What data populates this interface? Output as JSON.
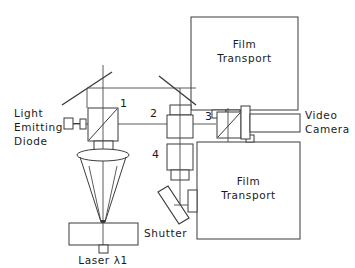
{
  "figure": {
    "type": "optical-system-schematic",
    "background_color": "#ffffff",
    "line_color": "#3b3b3b",
    "text_color": "#1a1a1a"
  },
  "labels": {
    "led_line1": "Light",
    "led_line2": "Emitting",
    "led_line3": "Diode",
    "film_transport_top_line1": "Film",
    "film_transport_top_line2": "Transport",
    "film_transport_bottom_line1": "Film",
    "film_transport_bottom_line2": "Transport",
    "video_camera_line1": "Video",
    "video_camera_line2": "Camera",
    "shutter": "Shutter",
    "laser": "Laser λ1"
  },
  "component_numbers": {
    "beamsplitter_1": "1",
    "lens_2": "2",
    "beamsplitter_3": "3",
    "lens_4": "4"
  },
  "components": [
    {
      "id": "light-emitting-diode",
      "label": "Light Emitting Diode",
      "number": null
    },
    {
      "id": "beamsplitter-cube-1",
      "label": "Beam splitter",
      "number": "1"
    },
    {
      "id": "objective-lens",
      "label": "Converging lens",
      "number": null
    },
    {
      "id": "shutter",
      "label": "Shutter",
      "number": null
    },
    {
      "id": "laser-source",
      "label": "Laser λ1",
      "number": null
    },
    {
      "id": "steering-mirror-left",
      "label": "Mirror",
      "number": null
    },
    {
      "id": "steering-mirror-right",
      "label": "Mirror",
      "number": null
    },
    {
      "id": "lens-barrel-2",
      "label": "Lens assembly",
      "number": "2"
    },
    {
      "id": "lens-barrel-4",
      "label": "Lens assembly",
      "number": "4"
    },
    {
      "id": "beamsplitter-cube-3",
      "label": "Beam splitter",
      "number": "3"
    },
    {
      "id": "video-camera",
      "label": "Video Camera",
      "number": null
    },
    {
      "id": "film-transport-top",
      "label": "Film Transport",
      "number": null
    },
    {
      "id": "film-transport-bottom",
      "label": "Film Transport",
      "number": null
    },
    {
      "id": "fold-mirror-bottom",
      "label": "Mirror",
      "number": null
    }
  ]
}
